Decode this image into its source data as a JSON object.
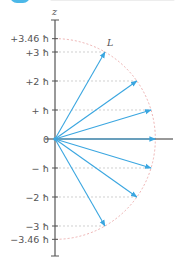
{
  "header": {
    "icon": "section-badge",
    "title_faded": ""
  },
  "colors": {
    "vector": "#3aa6e0",
    "axis": "#555555",
    "arc": "#e8a0a0",
    "guide": "#bbbbbb",
    "header": "#4cb8e8"
  },
  "diagram": {
    "axis_label": "z",
    "vector_label": "L",
    "origin_label": "0",
    "ticks": [
      {
        "label": "+3.46 ħ",
        "value": 3.46
      },
      {
        "label": "+3 ħ",
        "value": 3
      },
      {
        "label": "+2 ħ",
        "value": 2
      },
      {
        "label": "+ ħ",
        "value": 1
      },
      {
        "label": "0",
        "value": 0
      },
      {
        "label": "− ħ",
        "value": -1
      },
      {
        "label": "−2 ħ",
        "value": -2
      },
      {
        "label": "−3 ħ",
        "value": -3
      },
      {
        "label": "−3.46 ħ",
        "value": -3.46
      }
    ],
    "vectors_mz": [
      3,
      2,
      1,
      0,
      -1,
      -2,
      -3
    ],
    "magnitude": 3.46
  }
}
